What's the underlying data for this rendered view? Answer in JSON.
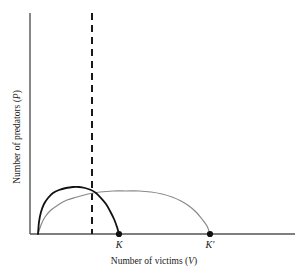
{
  "figure": {
    "background_color": "#ffffff",
    "axis_color": "#555555",
    "curve_primary_color": "#111111",
    "curve_secondary_color": "#888888",
    "dashed_line_color": "#1a1a1a",
    "point_color": "#111111"
  },
  "axes": {
    "ylabel_prefix": "Number of predators (",
    "ylabel_symbol": "P",
    "ylabel_suffix": ")",
    "ylabel_full": "Number of predators (P)",
    "xlabel_prefix": "Number of victims (",
    "xlabel_symbol": "V",
    "xlabel_suffix": ")",
    "xlabel_full": "Number of victims (V)"
  },
  "ticks": [
    {
      "label": "K",
      "x_px": 119
    },
    {
      "label": "K′",
      "x_px": 210
    }
  ],
  "chart_data": {
    "type": "line",
    "title": "",
    "subtitle": "",
    "xlabel": "Number of victims (V)",
    "ylabel": "Number of predators (P)",
    "grid": false,
    "legend": "none",
    "xlim": [
      0,
      1
    ],
    "ylim": [
      0,
      1
    ],
    "axis_ticks_x": [
      "K",
      "K′"
    ],
    "axis_ticks_y": [],
    "annotations": [
      {
        "name": "dashed-vertical-line",
        "kind": "vline",
        "x_px": 92,
        "style": "dashed",
        "note": "vertical dashed line marking predator isocline position"
      },
      {
        "name": "endpoint-K",
        "kind": "point",
        "label": "K",
        "x_px": 119,
        "y_px": 234
      },
      {
        "name": "endpoint-K-prime",
        "kind": "point",
        "label": "K′",
        "x_px": 210,
        "y_px": 234
      }
    ],
    "series": [
      {
        "name": "victim-isocline-low-K",
        "color": "#111111",
        "style": "solid",
        "width": 1.8,
        "description": "hump-shaped victim zero-growth isocline ending at carrying capacity K",
        "points_px": [
          [
            38,
            234
          ],
          [
            39,
            222
          ],
          [
            41,
            212
          ],
          [
            44,
            204
          ],
          [
            48,
            198
          ],
          [
            53,
            193
          ],
          [
            59,
            190
          ],
          [
            66,
            188
          ],
          [
            73,
            187
          ],
          [
            79,
            187
          ],
          [
            85,
            188
          ],
          [
            91,
            190
          ],
          [
            96,
            193
          ],
          [
            101,
            198
          ],
          [
            106,
            204
          ],
          [
            110,
            211
          ],
          [
            114,
            219
          ],
          [
            117,
            227
          ],
          [
            119,
            234
          ]
        ]
      },
      {
        "name": "victim-isocline-high-K",
        "color": "#888888",
        "style": "solid",
        "width": 1.2,
        "description": "flatter hump-shaped victim isocline ending at raised carrying capacity K-prime",
        "points_px": [
          [
            38,
            234
          ],
          [
            41,
            225
          ],
          [
            45,
            217
          ],
          [
            51,
            210
          ],
          [
            58,
            205
          ],
          [
            67,
            200
          ],
          [
            77,
            197
          ],
          [
            88,
            194
          ],
          [
            100,
            192
          ],
          [
            113,
            191
          ],
          [
            126,
            191
          ],
          [
            139,
            191
          ],
          [
            151,
            192
          ],
          [
            162,
            194
          ],
          [
            172,
            197
          ],
          [
            181,
            201
          ],
          [
            189,
            206
          ],
          [
            196,
            212
          ],
          [
            202,
            219
          ],
          [
            207,
            226
          ],
          [
            210,
            234
          ]
        ]
      }
    ]
  },
  "layout": {
    "y_axis_x_px": 30,
    "y_axis_top_px": 13,
    "x_axis_y_px": 234,
    "x_axis_left_px": 30,
    "x_axis_right_px": 295,
    "dashed_top_px": 13,
    "dashed_bottom_px": 234
  }
}
